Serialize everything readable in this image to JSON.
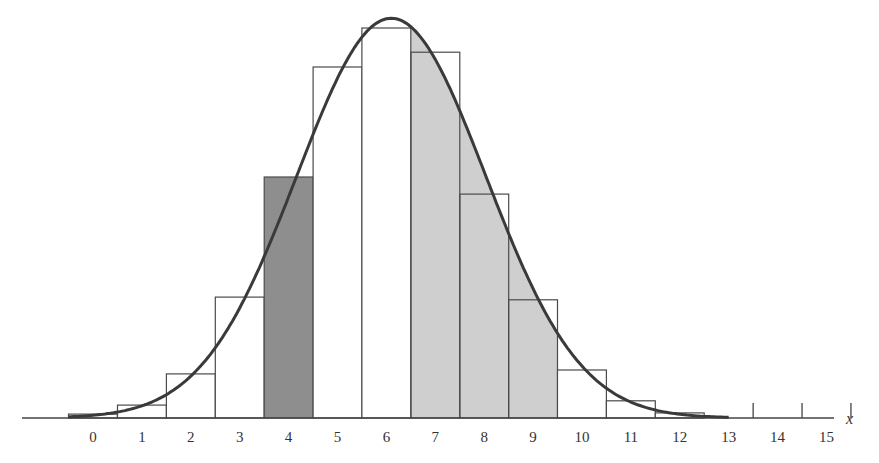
{
  "chart_data": {
    "type": "bar",
    "title": "",
    "xlabel": "x",
    "ylabel": "",
    "categories": [
      "0",
      "1",
      "2",
      "3",
      "4",
      "5",
      "6",
      "7",
      "8",
      "9",
      "10",
      "11",
      "12",
      "13",
      "14",
      "15"
    ],
    "values_px_height": [
      4,
      13,
      44,
      121,
      241,
      351,
      390,
      366,
      224,
      118,
      48,
      17,
      5,
      0,
      0,
      0
    ],
    "values_relative": [
      0.01,
      0.033,
      0.113,
      0.31,
      0.618,
      0.9,
      1.0,
      0.938,
      0.574,
      0.303,
      0.123,
      0.044,
      0.013,
      0,
      0,
      0
    ],
    "shading": {
      "dark_bar": [
        4
      ],
      "light_region_under_curve": [
        6.5,
        9.5
      ]
    },
    "overlay_curve": {
      "type": "normal",
      "mean": 6.1,
      "peak_relative": 1.025
    },
    "ticks_without_bars": [
      13.5,
      14.5,
      15.5
    ],
    "grid": false,
    "legend": null
  },
  "axis": {
    "x_variable": "x",
    "tick_labels": [
      "0",
      "1",
      "2",
      "3",
      "4",
      "5",
      "6",
      "7",
      "8",
      "9",
      "10",
      "11",
      "12",
      "13",
      "14",
      "15"
    ]
  },
  "colors": {
    "bar_stroke": "#4a4a4a",
    "curve": "#3a3a3a",
    "dark_fill": "#8e8e8e",
    "light_fill": "#cfcfcf",
    "background": "#ffffff"
  }
}
